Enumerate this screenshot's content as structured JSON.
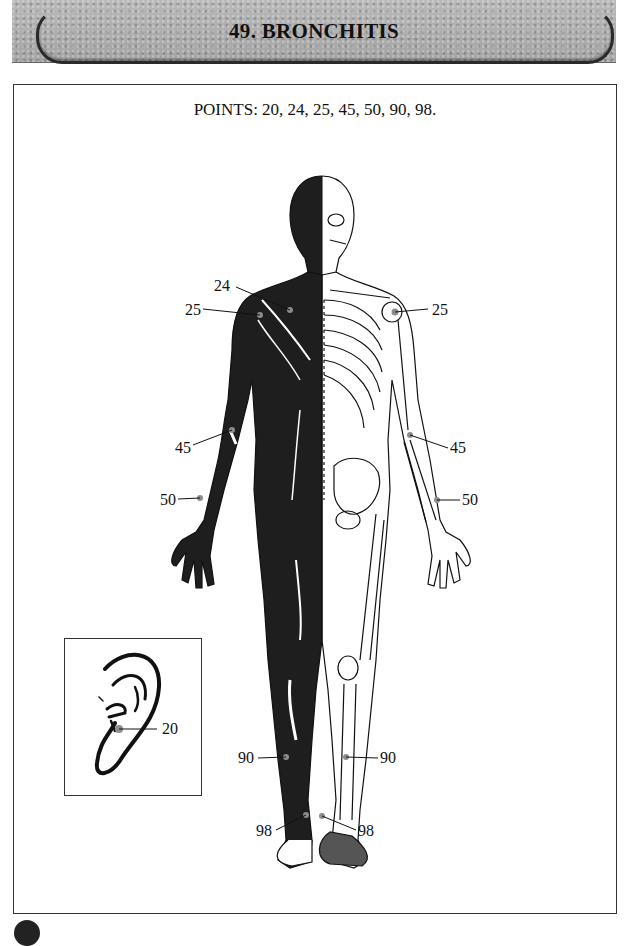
{
  "header": {
    "title": "49.  BRONCHITIS"
  },
  "points_line": "POINTS: 20, 24, 25, 45, 50, 90, 98.",
  "figure": {
    "labels": [
      {
        "id": "24",
        "text": "24",
        "side": "left",
        "region": "upper-chest"
      },
      {
        "id": "25-left",
        "text": "25",
        "side": "left",
        "region": "shoulder"
      },
      {
        "id": "25-right",
        "text": "25",
        "side": "right",
        "region": "shoulder"
      },
      {
        "id": "45-left",
        "text": "45",
        "side": "left",
        "region": "elbow"
      },
      {
        "id": "45-right",
        "text": "45",
        "side": "right",
        "region": "elbow"
      },
      {
        "id": "50-left",
        "text": "50",
        "side": "left",
        "region": "wrist"
      },
      {
        "id": "50-right",
        "text": "50",
        "side": "right",
        "region": "wrist"
      },
      {
        "id": "90-left",
        "text": "90",
        "side": "left",
        "region": "lower-leg"
      },
      {
        "id": "90-right",
        "text": "90",
        "side": "right",
        "region": "lower-leg"
      },
      {
        "id": "98-left",
        "text": "98",
        "side": "left",
        "region": "ankle"
      },
      {
        "id": "98-right",
        "text": "98",
        "side": "right",
        "region": "ankle"
      }
    ]
  },
  "ear_inset": {
    "label": "20",
    "description": "Ear diagram with point 20 marked"
  },
  "colors": {
    "banner": "#adadad",
    "ink": "#111111",
    "point_marker": "#8c8c8c",
    "muscle_fill": "#1e1e1e"
  }
}
